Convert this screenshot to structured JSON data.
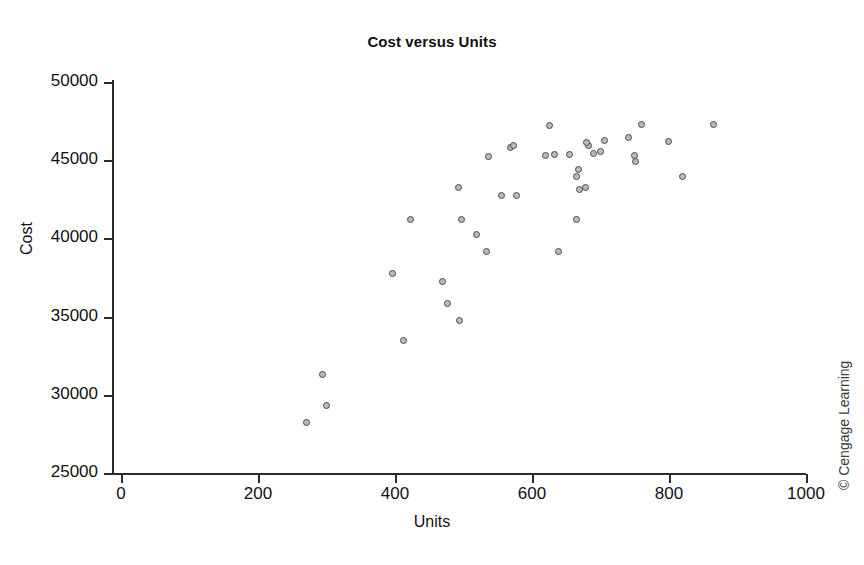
{
  "chart_data": {
    "type": "scatter",
    "title": "Cost versus Units",
    "xlabel": "Units",
    "ylabel": "Cost",
    "xlim": [
      0,
      1000
    ],
    "ylim": [
      25000,
      50000
    ],
    "xticks": [
      0,
      200,
      400,
      600,
      800,
      1000
    ],
    "yticks": [
      25000,
      30000,
      35000,
      40000,
      45000,
      50000
    ],
    "xtick_labels": [
      "0",
      "200",
      "400",
      "600",
      "800",
      "1000"
    ],
    "ytick_labels": [
      "25000",
      "30000",
      "35000",
      "40000",
      "45000",
      "50000"
    ],
    "grid": false,
    "legend": false,
    "marker": {
      "shape": "circle",
      "fill_color": "#b9b9bf",
      "edge_color": "#4a4a52",
      "size_px": 7
    },
    "n_points": 40,
    "points": [
      {
        "x": 271,
        "y": 28200
      },
      {
        "x": 300,
        "y": 29300
      },
      {
        "x": 295,
        "y": 31250
      },
      {
        "x": 413,
        "y": 33450
      },
      {
        "x": 495,
        "y": 34750
      },
      {
        "x": 478,
        "y": 35800
      },
      {
        "x": 470,
        "y": 37200
      },
      {
        "x": 397,
        "y": 37750
      },
      {
        "x": 534,
        "y": 39100
      },
      {
        "x": 640,
        "y": 39150
      },
      {
        "x": 520,
        "y": 40200
      },
      {
        "x": 498,
        "y": 41150
      },
      {
        "x": 424,
        "y": 41150
      },
      {
        "x": 665,
        "y": 41200
      },
      {
        "x": 670,
        "y": 43100
      },
      {
        "x": 679,
        "y": 43200
      },
      {
        "x": 556,
        "y": 42700
      },
      {
        "x": 578,
        "y": 42700
      },
      {
        "x": 494,
        "y": 43200
      },
      {
        "x": 665,
        "y": 43900
      },
      {
        "x": 821,
        "y": 43900
      },
      {
        "x": 668,
        "y": 44350
      },
      {
        "x": 752,
        "y": 44900
      },
      {
        "x": 537,
        "y": 45200
      },
      {
        "x": 750,
        "y": 45250
      },
      {
        "x": 620,
        "y": 45300
      },
      {
        "x": 634,
        "y": 45350
      },
      {
        "x": 655,
        "y": 45350
      },
      {
        "x": 690,
        "y": 45400
      },
      {
        "x": 700,
        "y": 45500
      },
      {
        "x": 570,
        "y": 45750
      },
      {
        "x": 573,
        "y": 45900
      },
      {
        "x": 683,
        "y": 45900
      },
      {
        "x": 680,
        "y": 46100
      },
      {
        "x": 800,
        "y": 46150
      },
      {
        "x": 706,
        "y": 46200
      },
      {
        "x": 741,
        "y": 46450
      },
      {
        "x": 627,
        "y": 47200
      },
      {
        "x": 760,
        "y": 47250
      },
      {
        "x": 865,
        "y": 47250
      }
    ]
  },
  "credit": "© Cengage Learning"
}
